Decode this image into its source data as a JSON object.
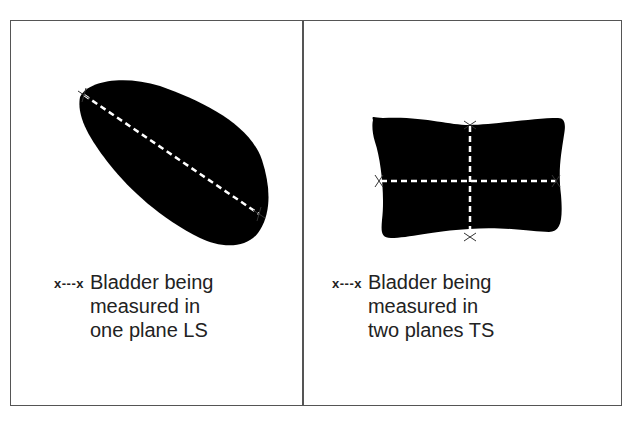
{
  "figure": {
    "panels": [
      {
        "id": "left",
        "shape": "irregular oval bladder outline (longitudinal section)",
        "measurement_lines": 1,
        "legend": {
          "key_symbol": "x---x",
          "lines": [
            "Bladder being",
            "measured in",
            "one plane LS"
          ]
        }
      },
      {
        "id": "right",
        "shape": "rectangular bladder outline (transverse section)",
        "measurement_lines": 2,
        "legend": {
          "key_symbol": "x---x",
          "lines": [
            "Bladder being",
            "measured in",
            "two planes TS"
          ]
        }
      }
    ],
    "colors": {
      "shape_fill": "#000000",
      "measure_line": "#ffffff",
      "border": "#555555",
      "background": "#ffffff"
    }
  }
}
